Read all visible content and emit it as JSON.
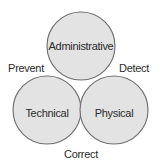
{
  "diagram": {
    "type": "venn-three-circle",
    "background_color": "#ffffff",
    "circle_fill_color": "#e3e3e3",
    "circle_stroke_color": "#6f6f6f",
    "text_color": "#2b2b2b",
    "circles": [
      {
        "id": "administrative",
        "label": "Administrative",
        "position": "top-center",
        "cx": 81,
        "cy": 46,
        "r": 34
      },
      {
        "id": "technical",
        "label": "Technical",
        "position": "bottom-left",
        "cx": 47,
        "cy": 110,
        "r": 34
      },
      {
        "id": "physical",
        "label": "Physical",
        "position": "bottom-right",
        "cx": 114,
        "cy": 110,
        "r": 34
      }
    ],
    "outer_labels": [
      {
        "id": "prevent",
        "label": "Prevent",
        "position": "left"
      },
      {
        "id": "detect",
        "label": "Detect",
        "position": "right"
      },
      {
        "id": "correct",
        "label": "Correct",
        "position": "bottom"
      }
    ]
  }
}
